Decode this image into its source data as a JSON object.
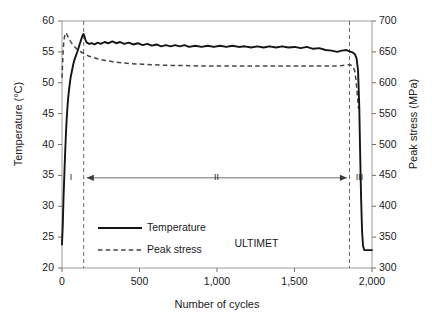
{
  "chart_data": {
    "type": "line",
    "title": "",
    "xlabel": "Number of cycles",
    "ylabel": "Temperature (°C)",
    "y2label": "Peak stress (MPa)",
    "xlim": [
      0,
      2000
    ],
    "ylim": [
      20,
      60
    ],
    "y2lim": [
      300,
      700
    ],
    "xticks": [
      "0",
      "500",
      "1,000",
      "1,500",
      "2,000"
    ],
    "xtick_values": [
      0,
      500,
      1000,
      1500,
      2000
    ],
    "yticks": [
      "20",
      "25",
      "30",
      "35",
      "40",
      "45",
      "50",
      "55",
      "60"
    ],
    "ytick_values": [
      20,
      25,
      30,
      35,
      40,
      45,
      50,
      55,
      60
    ],
    "y2ticks": [
      "300",
      "350",
      "400",
      "450",
      "500",
      "550",
      "600",
      "650",
      "700"
    ],
    "y2tick_values": [
      300,
      350,
      400,
      450,
      500,
      550,
      600,
      650,
      700
    ],
    "grid": false,
    "legend_position": "lower-left-inside",
    "series": [
      {
        "name": "Temperature",
        "axis": "left",
        "style": "solid",
        "color": "#1a1a1a",
        "unit": "°C",
        "points": [
          [
            0,
            23.8
          ],
          [
            5,
            27.0
          ],
          [
            10,
            31.5
          ],
          [
            15,
            35.0
          ],
          [
            20,
            38.5
          ],
          [
            25,
            41.5
          ],
          [
            30,
            44.0
          ],
          [
            35,
            46.0
          ],
          [
            40,
            47.6
          ],
          [
            48,
            49.4
          ],
          [
            56,
            50.9
          ],
          [
            64,
            51.9
          ],
          [
            72,
            52.9
          ],
          [
            80,
            53.7
          ],
          [
            90,
            54.4
          ],
          [
            100,
            55.1
          ],
          [
            110,
            55.9
          ],
          [
            120,
            56.7
          ],
          [
            130,
            57.5
          ],
          [
            138,
            57.9
          ],
          [
            145,
            57.5
          ],
          [
            152,
            56.9
          ],
          [
            160,
            56.5
          ],
          [
            175,
            56.3
          ],
          [
            190,
            56.4
          ],
          [
            210,
            56.2
          ],
          [
            230,
            56.5
          ],
          [
            250,
            56.3
          ],
          [
            275,
            56.6
          ],
          [
            300,
            56.4
          ],
          [
            325,
            56.7
          ],
          [
            350,
            56.4
          ],
          [
            375,
            56.6
          ],
          [
            400,
            56.3
          ],
          [
            430,
            56.5
          ],
          [
            460,
            56.2
          ],
          [
            490,
            56.4
          ],
          [
            520,
            56.1
          ],
          [
            550,
            56.3
          ],
          [
            580,
            56.0
          ],
          [
            610,
            56.2
          ],
          [
            640,
            55.9
          ],
          [
            670,
            56.1
          ],
          [
            700,
            55.9
          ],
          [
            730,
            56.1
          ],
          [
            760,
            55.9
          ],
          [
            790,
            56.1
          ],
          [
            820,
            55.8
          ],
          [
            860,
            56.0
          ],
          [
            900,
            55.8
          ],
          [
            940,
            56.0
          ],
          [
            980,
            55.8
          ],
          [
            1020,
            56.0
          ],
          [
            1060,
            55.8
          ],
          [
            1100,
            56.0
          ],
          [
            1140,
            55.8
          ],
          [
            1180,
            55.9
          ],
          [
            1220,
            55.7
          ],
          [
            1260,
            55.9
          ],
          [
            1300,
            55.7
          ],
          [
            1340,
            55.9
          ],
          [
            1380,
            55.7
          ],
          [
            1420,
            55.9
          ],
          [
            1460,
            55.7
          ],
          [
            1500,
            55.8
          ],
          [
            1540,
            55.6
          ],
          [
            1580,
            55.8
          ],
          [
            1620,
            55.5
          ],
          [
            1660,
            55.6
          ],
          [
            1700,
            55.3
          ],
          [
            1740,
            55.2
          ],
          [
            1775,
            55.0
          ],
          [
            1805,
            55.2
          ],
          [
            1835,
            55.3
          ],
          [
            1855,
            55.1
          ],
          [
            1875,
            54.9
          ],
          [
            1890,
            54.6
          ],
          [
            1900,
            54.0
          ],
          [
            1910,
            52.0
          ],
          [
            1918,
            46.0
          ],
          [
            1924,
            38.0
          ],
          [
            1930,
            31.0
          ],
          [
            1936,
            26.0
          ],
          [
            1942,
            23.6
          ],
          [
            1950,
            22.9
          ],
          [
            1975,
            22.9
          ],
          [
            2000,
            22.9
          ]
        ]
      },
      {
        "name": "Peak stress",
        "axis": "right",
        "style": "dashed",
        "color": "#3c3c3c",
        "unit": "MPa",
        "points": [
          [
            0,
            608
          ],
          [
            6,
            645
          ],
          [
            12,
            668
          ],
          [
            18,
            677
          ],
          [
            24,
            681
          ],
          [
            30,
            679
          ],
          [
            40,
            674
          ],
          [
            50,
            669
          ],
          [
            60,
            665
          ],
          [
            75,
            660
          ],
          [
            90,
            656
          ],
          [
            110,
            652
          ],
          [
            130,
            649
          ],
          [
            150,
            646
          ],
          [
            175,
            643
          ],
          [
            200,
            641
          ],
          [
            240,
            638
          ],
          [
            280,
            636
          ],
          [
            330,
            634
          ],
          [
            390,
            632
          ],
          [
            450,
            631
          ],
          [
            520,
            630
          ],
          [
            600,
            629
          ],
          [
            700,
            628
          ],
          [
            800,
            628
          ],
          [
            900,
            627
          ],
          [
            1000,
            627
          ],
          [
            1100,
            627
          ],
          [
            1200,
            627
          ],
          [
            1300,
            627
          ],
          [
            1400,
            627
          ],
          [
            1500,
            627
          ],
          [
            1600,
            627
          ],
          [
            1700,
            627
          ],
          [
            1760,
            627
          ],
          [
            1810,
            628
          ],
          [
            1840,
            629
          ],
          [
            1860,
            629
          ],
          [
            1875,
            627
          ],
          [
            1888,
            620
          ],
          [
            1896,
            606
          ],
          [
            1902,
            590
          ],
          [
            1908,
            573
          ],
          [
            1913,
            558
          ]
        ]
      }
    ],
    "vertical_markers": [
      {
        "label": "stage-boundary-1",
        "x": 140
      },
      {
        "label": "stage-boundary-2",
        "x": 1855
      }
    ],
    "region_labels": [
      {
        "text": "I",
        "x": 70,
        "y": 34.6
      },
      {
        "text": "II",
        "x": 1000,
        "y": 34.6
      },
      {
        "text": "III",
        "x": 1915,
        "y": 34.6
      }
    ],
    "span_arrow": {
      "from": 160,
      "to": 1838,
      "y": 34.6
    },
    "annotations": [
      {
        "name": "material-label",
        "text": "ULTIMET",
        "x": 1280,
        "y": 23.9
      }
    ],
    "legend": [
      {
        "label": "Temperature",
        "style": "solid"
      },
      {
        "label": "Peak stress",
        "style": "dashed"
      }
    ]
  }
}
